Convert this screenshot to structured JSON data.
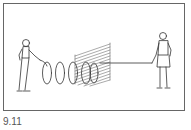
{
  "figure": {
    "caption": "9.11",
    "elements": [
      "person-left",
      "helical-rope-wave",
      "slatted-polarizer",
      "straight-rope",
      "person-right"
    ],
    "colors": {
      "line": "#333333",
      "border": "#666666",
      "background": "#ffffff"
    }
  }
}
